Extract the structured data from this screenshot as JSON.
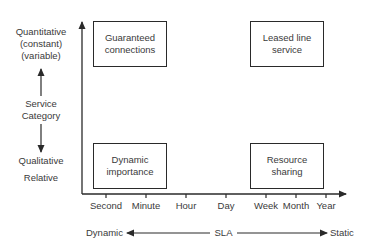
{
  "diagram": {
    "y_axis": {
      "top_label": [
        "Quantitative",
        "(constant)",
        "(variable)"
      ],
      "middle_label": [
        "Service",
        "Category"
      ],
      "bottom_label": [
        "Qualitative",
        "Relative"
      ]
    },
    "x_axis": {
      "ticks": [
        "Second",
        "Minute",
        "Hour",
        "Day",
        "Week",
        "Month",
        "Year"
      ]
    },
    "sla_row": {
      "left": "Dynamic",
      "center": "SLA",
      "right": "Static"
    },
    "boxes": {
      "top_left": [
        "Guaranteed",
        "connections"
      ],
      "top_right": [
        "Leased line",
        "service"
      ],
      "bottom_left": [
        "Dynamic",
        "importance"
      ],
      "bottom_right": [
        "Resource",
        "sharing"
      ]
    },
    "colors": {
      "line": "#2a2a2a",
      "text": "#3a3a3a"
    }
  }
}
